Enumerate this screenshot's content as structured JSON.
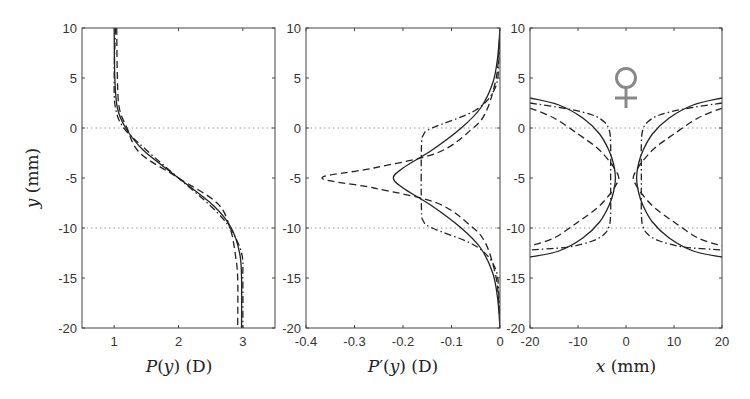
{
  "chart_data": [
    {
      "type": "line",
      "panel": "left",
      "title": "",
      "xlabel": "P(y) (D)",
      "ylabel": "y (mm)",
      "xlim": [
        0.5,
        3.5
      ],
      "ylim": [
        -20,
        10
      ],
      "xticks": [
        1,
        2,
        3
      ],
      "yticks": [
        10,
        5,
        0,
        -5,
        -10,
        -15,
        -20
      ],
      "reference_lines_y": [
        0,
        -10
      ],
      "series": [
        {
          "name": "solid",
          "style": "solid",
          "x": [
            1.0,
            1.01,
            1.05,
            1.18,
            1.45,
            2.0,
            2.55,
            2.82,
            2.95,
            2.98,
            2.98
          ],
          "y": [
            10,
            5,
            2,
            0,
            -2.2,
            -5,
            -7.8,
            -10,
            -12.5,
            -15,
            -20
          ]
        },
        {
          "name": "dashed",
          "style": "dashed",
          "x": [
            1.04,
            1.05,
            1.08,
            1.2,
            1.4,
            2.0,
            2.6,
            2.8,
            2.88,
            2.92,
            2.92
          ],
          "y": [
            10,
            5,
            2,
            0,
            -2.5,
            -5,
            -7.5,
            -10,
            -12.5,
            -15,
            -20
          ]
        },
        {
          "name": "dash-dot",
          "style": "dashdot",
          "x": [
            1.02,
            1.0,
            1.02,
            1.15,
            1.5,
            2.0,
            2.5,
            2.8,
            2.98,
            3.0,
            3.0
          ],
          "y": [
            10,
            5,
            2,
            0,
            -2.2,
            -5,
            -7.8,
            -10,
            -12.5,
            -15,
            -20
          ]
        }
      ]
    },
    {
      "type": "line",
      "panel": "middle",
      "title": "",
      "xlabel": "P'(y) (D)",
      "ylabel": "",
      "xlim": [
        -0.4,
        0
      ],
      "ylim": [
        -20,
        10
      ],
      "xticks": [
        -0.4,
        -0.3,
        -0.2,
        -0.1,
        0
      ],
      "yticks": [
        10,
        5,
        0,
        -5,
        -10,
        -15,
        -20
      ],
      "reference_lines_y": [
        0,
        -10
      ],
      "series": [
        {
          "name": "solid",
          "style": "solid",
          "x": [
            0,
            -0.005,
            -0.015,
            -0.04,
            -0.08,
            -0.14,
            -0.2,
            -0.22,
            -0.2,
            -0.14,
            -0.08,
            -0.04,
            -0.015,
            -0.005,
            0
          ],
          "y": [
            10,
            7,
            4.5,
            2,
            0,
            -2.2,
            -4,
            -5,
            -6,
            -7.8,
            -10,
            -12,
            -14.5,
            -17,
            -20
          ]
        },
        {
          "name": "dashed",
          "style": "dashed",
          "x": [
            0,
            -0.003,
            -0.01,
            -0.03,
            -0.06,
            -0.13,
            -0.26,
            -0.367,
            -0.26,
            -0.13,
            -0.06,
            -0.03,
            -0.01,
            -0.003,
            0
          ],
          "y": [
            10,
            7,
            4.5,
            1.5,
            -0.2,
            -2.5,
            -4.0,
            -5,
            -6.0,
            -7.5,
            -9.8,
            -11.5,
            -14.5,
            -17,
            -20
          ]
        },
        {
          "name": "dash-dot",
          "style": "dashdot",
          "x": [
            0,
            -0.002,
            -0.01,
            -0.05,
            -0.14,
            -0.158,
            -0.162,
            -0.162,
            -0.158,
            -0.14,
            -0.05,
            -0.01,
            -0.002,
            0
          ],
          "y": [
            10,
            7,
            4,
            1.8,
            0,
            -0.7,
            -2,
            -8,
            -9.3,
            -10,
            -11.8,
            -14,
            -17,
            -20
          ]
        }
      ]
    },
    {
      "type": "line",
      "panel": "right",
      "title": "",
      "xlabel": "x (mm)",
      "ylabel": "",
      "xlim": [
        -20,
        20
      ],
      "ylim": [
        -20,
        10
      ],
      "xticks": [
        -20,
        -10,
        0,
        10,
        20
      ],
      "yticks": [
        10,
        5,
        0,
        -5,
        -10,
        -15,
        -20
      ],
      "reference_lines_y": [
        0,
        -10
      ],
      "annotation": "♀",
      "series": [
        {
          "name": "solid",
          "style": "solid",
          "x": [
            -20,
            -14,
            -9,
            -5.5,
            -3.5,
            -2.6,
            -2.2,
            -2.6,
            -3.5,
            -5.5,
            -9,
            -14,
            -20
          ],
          "y": [
            3.0,
            2.3,
            1.0,
            -0.6,
            -2.3,
            -3.6,
            -5,
            -6.4,
            -7.7,
            -9.4,
            -11.0,
            -12.3,
            -12.9
          ]
        },
        {
          "name": "dashed",
          "style": "dashed",
          "x": [
            -20,
            -15,
            -10,
            -6,
            -3.5,
            -2.2,
            -1.5,
            -2.2,
            -3.5,
            -6,
            -10,
            -15,
            -20
          ],
          "y": [
            2.0,
            1.0,
            -0.6,
            -2.0,
            -3.3,
            -4.2,
            -5,
            -5.8,
            -6.7,
            -8.0,
            -9.4,
            -11.0,
            -11.8
          ]
        },
        {
          "name": "dash-dot",
          "style": "dashdot",
          "x": [
            -20,
            -12,
            -7,
            -4.5,
            -3.5,
            -3.2,
            -3.2,
            -3.2,
            -3.5,
            -4.5,
            -7,
            -12,
            -20
          ],
          "y": [
            2.5,
            1.9,
            1.3,
            0.6,
            -0.2,
            -1.5,
            -5,
            -8.5,
            -9.8,
            -10.6,
            -11.3,
            -11.9,
            -12.2
          ]
        }
      ],
      "mirror_about_x0": true
    }
  ],
  "layout": {
    "panels": [
      {
        "left": 82,
        "top": 28,
        "width": 193,
        "height": 300
      },
      {
        "left": 306,
        "top": 28,
        "width": 194,
        "height": 300
      },
      {
        "left": 530,
        "top": 28,
        "width": 192,
        "height": 300
      }
    ],
    "annotation_color": "#888888",
    "line_color": "#222222",
    "refline_color": "#999999"
  }
}
